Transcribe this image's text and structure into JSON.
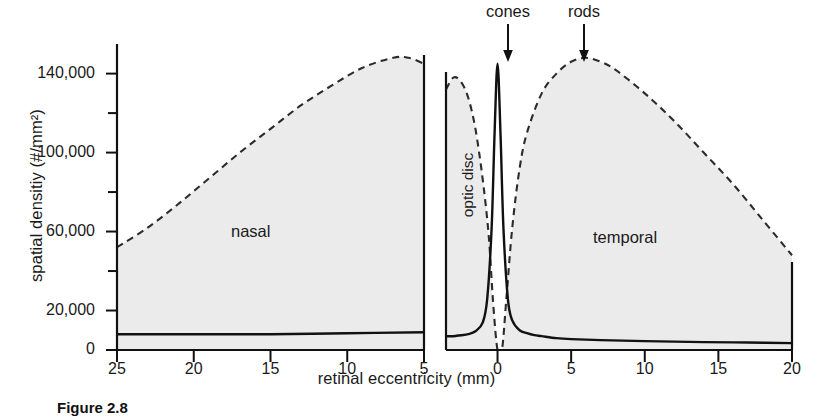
{
  "figure": {
    "caption": "Figure 2.8",
    "background": "#ffffff",
    "shade_color": "#ebebeb",
    "ink_color": "#1a1a1a"
  },
  "axes": {
    "ylabel": "spatial densitiy (#/mm2)",
    "ylabel_display": "spatial densitiy (#/mm²)",
    "xlabel": "retinal eccentricity (mm)",
    "yticks_major": [
      "0",
      "20,000",
      "60,000",
      "100,000",
      "140,000"
    ],
    "yticks_major_values": [
      0,
      20000,
      60000,
      100000,
      140000
    ],
    "yticks_minor_values": [
      40000,
      80000,
      120000
    ],
    "ylim": [
      0,
      155000
    ],
    "left_panel_xticks": [
      "25",
      "20",
      "15",
      "10",
      "5"
    ],
    "right_panel_xticks": [
      "0",
      "5",
      "10",
      "15",
      "20"
    ]
  },
  "annotations": {
    "nasal": "nasal",
    "temporal": "temporal",
    "optic_disc": "optic disc",
    "cones": "cones",
    "rods": "rods"
  },
  "chart_data": {
    "type": "area",
    "title": "",
    "subtitle": "",
    "xlabel": "retinal eccentricity (mm)",
    "ylabel": "spatial densitiy (#/mm²)",
    "ylim": [
      0,
      155000
    ],
    "grid": false,
    "legend": "in-plot arrow labels",
    "panels": [
      {
        "name": "nasal",
        "xlim": [
          25,
          5
        ],
        "x_direction": "descending",
        "series": [
          {
            "name": "rods",
            "style": "dashed",
            "filled": true,
            "x": [
              25,
              23,
              21,
              19,
              17,
              15,
              13,
              11,
              9,
              7,
              6,
              5
            ],
            "values": [
              52000,
              62000,
              74000,
              87000,
              100000,
              112000,
              124000,
              134000,
              143000,
              148000,
              148000,
              145000
            ]
          },
          {
            "name": "cones",
            "style": "solid",
            "filled": false,
            "x": [
              25,
              20,
              15,
              10,
              5
            ],
            "values": [
              8000,
              8000,
              8000,
              8500,
              9000
            ]
          }
        ]
      },
      {
        "name": "temporal",
        "xlim": [
          -3.5,
          20
        ],
        "x_direction": "ascending",
        "series": [
          {
            "name": "rods",
            "style": "dashed",
            "filled": true,
            "x": [
              -3.5,
              -3,
              -2.5,
              -2,
              -1.5,
              -1,
              -0.6,
              -0.3,
              0,
              0.3,
              0.6,
              1,
              1.5,
              2,
              3,
              4,
              5,
              6,
              7,
              8,
              10,
              12,
              14,
              16,
              18,
              20
            ],
            "values": [
              132000,
              138000,
              136000,
              128000,
              112000,
              86000,
              58000,
              24000,
              0,
              0,
              26000,
              62000,
              92000,
              110000,
              130000,
              140000,
              146000,
              148000,
              146000,
              142000,
              130000,
              116000,
              100000,
              84000,
              66000,
              48000
            ]
          },
          {
            "name": "cones",
            "style": "solid",
            "filled": false,
            "x": [
              -3.5,
              -3,
              -2.5,
              -2,
              -1.5,
              -1,
              -0.7,
              -0.4,
              -0.2,
              0,
              0.2,
              0.4,
              0.7,
              1,
              1.5,
              2,
              2.5,
              3,
              4,
              5,
              7,
              10,
              14,
              17,
              20
            ],
            "values": [
              7000,
              7000,
              7500,
              8000,
              9500,
              14000,
              26000,
              62000,
              110000,
              145000,
              110000,
              62000,
              26000,
              15000,
              10000,
              8500,
              7500,
              7000,
              6000,
              5500,
              5000,
              4500,
              4000,
              3800,
              3500
            ]
          }
        ]
      }
    ],
    "pointers": [
      {
        "label": "cones",
        "points_to": "cone peak at fovea (0 mm temporal)",
        "value": 145000
      },
      {
        "label": "rods",
        "points_to": "rod peak (~6 mm temporal)",
        "value": 148000
      }
    ],
    "gap": {
      "label": "optic disc",
      "between_panels": true,
      "value": 0
    }
  }
}
